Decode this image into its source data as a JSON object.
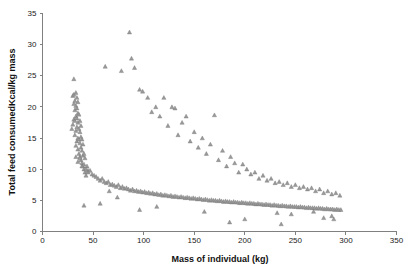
{
  "chart_data": {
    "type": "scatter",
    "title": "",
    "xlabel": "Mass of individual (kg)",
    "ylabel": "Total feed consumedKcal/kg mass",
    "xlim": [
      0,
      350
    ],
    "ylim": [
      0,
      35
    ],
    "xticks": [
      0,
      50,
      100,
      150,
      200,
      250,
      300,
      350
    ],
    "yticks": [
      0,
      5,
      10,
      15,
      20,
      25,
      30,
      35
    ],
    "grid": false,
    "legend": null,
    "marker": "triangle",
    "marker_color": "#9a9a9a",
    "series": [
      {
        "name": "individuals",
        "x": [
          29,
          30,
          30,
          31,
          31,
          31,
          32,
          32,
          32,
          32,
          33,
          33,
          33,
          33,
          33,
          34,
          34,
          34,
          34,
          34,
          35,
          35,
          35,
          35,
          35,
          36,
          36,
          36,
          36,
          37,
          37,
          37,
          37,
          38,
          38,
          38,
          38,
          39,
          39,
          39,
          40,
          40,
          40,
          41,
          41,
          42,
          42,
          43,
          44,
          45,
          31,
          33,
          35,
          37,
          39,
          41,
          43,
          45,
          47,
          49,
          51,
          53,
          55,
          57,
          59,
          61,
          63,
          65,
          67,
          69,
          71,
          73,
          75,
          77,
          79,
          81,
          83,
          85,
          87,
          89,
          91,
          93,
          95,
          97,
          99,
          101,
          103,
          105,
          107,
          109,
          111,
          113,
          115,
          117,
          119,
          121,
          123,
          125,
          127,
          129,
          131,
          133,
          135,
          137,
          139,
          141,
          143,
          145,
          147,
          149,
          151,
          153,
          155,
          157,
          159,
          161,
          163,
          165,
          167,
          169,
          171,
          173,
          175,
          177,
          179,
          181,
          183,
          185,
          187,
          189,
          191,
          193,
          195,
          197,
          199,
          201,
          203,
          205,
          207,
          209,
          211,
          213,
          215,
          217,
          219,
          221,
          223,
          225,
          227,
          229,
          231,
          233,
          235,
          237,
          239,
          241,
          243,
          245,
          247,
          249,
          251,
          253,
          255,
          257,
          259,
          261,
          263,
          265,
          267,
          269,
          271,
          273,
          275,
          277,
          279,
          281,
          283,
          285,
          287,
          289,
          291,
          293,
          295,
          62,
          78,
          86,
          88,
          91,
          96,
          99,
          104,
          108,
          112,
          116,
          120,
          124,
          128,
          131,
          134,
          138,
          142,
          146,
          150,
          154,
          158,
          162,
          166,
          170,
          174,
          178,
          182,
          186,
          190,
          194,
          198,
          202,
          206,
          210,
          214,
          218,
          222,
          226,
          230,
          234,
          238,
          242,
          246,
          250,
          254,
          258,
          262,
          266,
          270,
          274,
          278,
          282,
          286,
          290,
          294,
          185,
          200,
          236,
          278,
          288,
          41,
          57,
          66,
          74,
          96,
          113,
          160,
          232,
          246,
          268,
          286
        ],
        "y": [
          16.5,
          17.2,
          21.8,
          18.0,
          20.5,
          22.0,
          15.5,
          17.8,
          19.5,
          21.0,
          13.8,
          16.2,
          18.5,
          20.2,
          22.3,
          14.5,
          16.8,
          18.2,
          19.8,
          21.5,
          13.2,
          15.0,
          17.5,
          19.0,
          20.8,
          12.5,
          14.8,
          16.5,
          18.8,
          12.0,
          14.2,
          16.0,
          17.8,
          11.5,
          13.5,
          15.2,
          17.0,
          11.0,
          13.0,
          14.8,
          10.5,
          12.2,
          14.0,
          10.0,
          12.5,
          9.5,
          11.8,
          9.0,
          10.5,
          9.8,
          24.5,
          12.0,
          11.2,
          11.8,
          10.5,
          10.8,
          10.0,
          9.5,
          9.8,
          9.2,
          9.0,
          8.8,
          8.5,
          8.2,
          8.5,
          8.0,
          7.8,
          8.0,
          7.5,
          7.6,
          7.4,
          7.2,
          7.5,
          7.0,
          7.2,
          6.9,
          7.0,
          6.8,
          6.6,
          6.8,
          6.5,
          6.6,
          6.4,
          6.5,
          6.3,
          6.4,
          6.2,
          6.3,
          6.1,
          6.2,
          6.0,
          6.1,
          5.9,
          6.0,
          5.8,
          5.9,
          5.8,
          5.7,
          5.8,
          5.6,
          5.7,
          5.6,
          5.5,
          5.6,
          5.5,
          5.4,
          5.5,
          5.4,
          5.3,
          5.4,
          5.3,
          5.2,
          5.3,
          5.2,
          5.1,
          5.2,
          5.1,
          5.0,
          5.1,
          5.0,
          5.0,
          4.9,
          5.0,
          4.9,
          4.8,
          4.9,
          4.8,
          4.8,
          4.7,
          4.8,
          4.7,
          4.7,
          4.6,
          4.7,
          4.6,
          4.6,
          4.5,
          4.6,
          4.5,
          4.5,
          4.4,
          4.5,
          4.4,
          4.4,
          4.3,
          4.4,
          4.3,
          4.3,
          4.2,
          4.3,
          4.2,
          4.2,
          4.1,
          4.2,
          4.1,
          4.1,
          4.0,
          4.1,
          4.0,
          4.0,
          4.0,
          3.9,
          4.0,
          3.9,
          3.9,
          3.8,
          3.9,
          3.8,
          3.8,
          3.8,
          3.7,
          3.8,
          3.7,
          3.7,
          3.6,
          3.7,
          3.6,
          3.6,
          3.6,
          3.5,
          3.6,
          3.5,
          3.5,
          26.5,
          25.8,
          32.0,
          27.8,
          26.3,
          22.8,
          22.5,
          21.5,
          19.2,
          20.0,
          18.5,
          21.5,
          17.0,
          20.0,
          19.8,
          15.5,
          17.5,
          18.5,
          14.5,
          16.0,
          13.5,
          15.0,
          12.5,
          14.0,
          18.7,
          11.5,
          13.0,
          10.5,
          12.0,
          11.0,
          9.5,
          10.8,
          10.0,
          9.2,
          9.5,
          8.5,
          9.0,
          8.2,
          8.5,
          7.8,
          8.0,
          7.5,
          7.8,
          7.2,
          7.5,
          7.0,
          7.2,
          6.8,
          7.0,
          6.5,
          6.8,
          6.2,
          6.5,
          6.0,
          6.2,
          5.8,
          1.5,
          2.0,
          1.2,
          2.2,
          2.0,
          4.2,
          4.5,
          6.5,
          5.5,
          3.5,
          4.0,
          3.2,
          3.0,
          2.8,
          3.2,
          2.5
        ]
      }
    ]
  },
  "axes": {
    "y_title": "Total feed consumedKcal/kg mass",
    "x_title": "Mass of individual (kg)"
  }
}
